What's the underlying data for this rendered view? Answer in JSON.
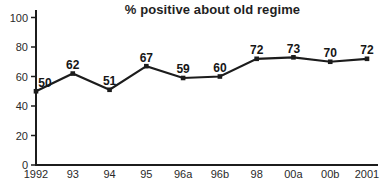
{
  "chart_data": {
    "type": "line",
    "title": "% positive about old regime",
    "categories": [
      "1992",
      "93",
      "94",
      "95",
      "96a",
      "96b",
      "98",
      "00a",
      "00b",
      "2001"
    ],
    "values": [
      50,
      62,
      51,
      67,
      59,
      60,
      72,
      73,
      70,
      72
    ],
    "xlabel": "",
    "ylabel": "",
    "ylim": [
      0,
      100
    ],
    "yticks": [
      0,
      20,
      40,
      60,
      80,
      100
    ],
    "grid": false,
    "legend": "none",
    "line_color": "#1c1c1c",
    "marker": "square",
    "data_labels": true
  }
}
